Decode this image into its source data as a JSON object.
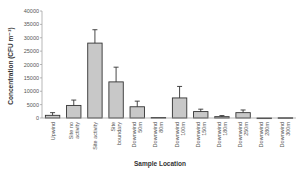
{
  "chart_data": {
    "type": "bar",
    "title": "",
    "xlabel": "Sample Location",
    "ylabel": "Concentration (CFU m⁻³)",
    "ylim": [
      0,
      40000
    ],
    "yticks": [
      0,
      5000,
      10000,
      15000,
      20000,
      25000,
      30000,
      35000,
      40000
    ],
    "grid": false,
    "legend": "none",
    "categories": [
      [
        "Upwind"
      ],
      [
        "Site no",
        "activity"
      ],
      [
        "Site activity"
      ],
      [
        "Site",
        "boundary"
      ],
      [
        "Downwind",
        "50m"
      ],
      [
        "Downwind",
        "80m"
      ],
      [
        "Downwind",
        "100m"
      ],
      [
        "Downwind",
        "150m"
      ],
      [
        "Downwind",
        "180m"
      ],
      [
        "Downwind",
        "250m"
      ],
      [
        "Downwind",
        "280m"
      ],
      [
        "Downwind",
        "300m"
      ]
    ],
    "series": [
      {
        "name": "Concentration",
        "values": [
          1000,
          4700,
          28000,
          13500,
          4200,
          200,
          7500,
          2400,
          500,
          2000,
          0,
          100
        ],
        "error_upper": [
          2000,
          6700,
          33000,
          19000,
          6300,
          200,
          11800,
          3300,
          900,
          3000,
          0,
          100
        ]
      }
    ]
  }
}
